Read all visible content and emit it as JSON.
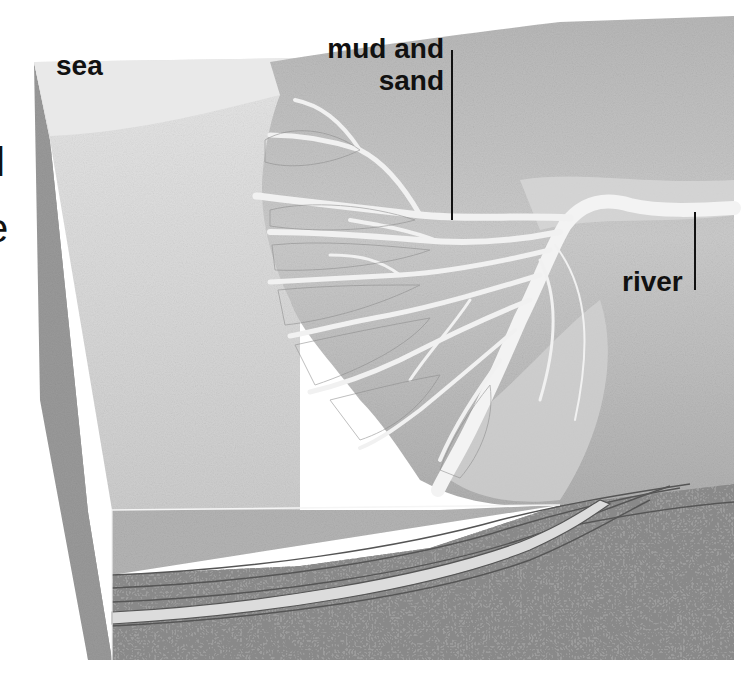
{
  "figure": {
    "type": "geological block diagram",
    "labels": {
      "sea": "sea",
      "mud_and_sand_line1": "mud and",
      "mud_and_sand_line2": "sand",
      "river": "river"
    },
    "cropped_text_fragments": {
      "left_upper": "l",
      "left_lower": "e"
    },
    "colors": {
      "background": "#ffffff",
      "sea_light": "#e2e2e2",
      "sea_mid": "#cfcfcf",
      "land": "#bdbdbd",
      "land_dark": "#a9a9a9",
      "channel": "#f1f1f1",
      "front_water": "#b4b4b4",
      "sediment": "#9c9c9c",
      "sand_layer": "#dcdcdc",
      "side_face": "#8f8f8f",
      "text": "#111111"
    }
  }
}
